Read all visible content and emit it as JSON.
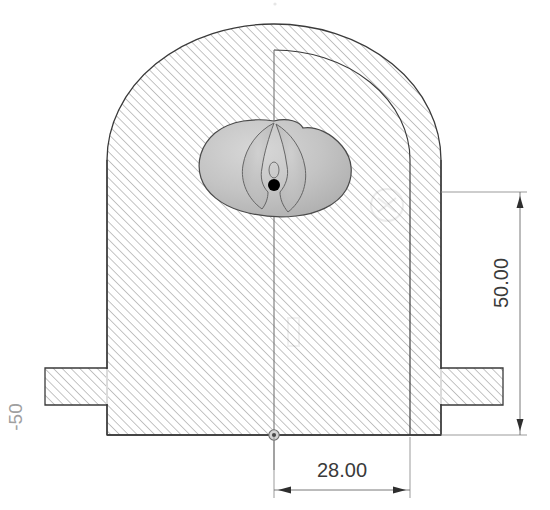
{
  "drawing": {
    "title": "Sectional View of Valve Body Casting",
    "type": "engineering-section-drawing",
    "background_color": "#ffffff",
    "line_color": "#3a3a3a",
    "hatch_color": "#9a9a9a",
    "shade_fill_light": "#c9c9c9",
    "shade_fill_dark": "#b0b0b0",
    "datum_color": "#000000"
  },
  "dimensions": [
    {
      "name": "vertical-height",
      "value": "50.00",
      "orientation": "vertical",
      "text_rotation_deg": -90,
      "arrow_style": "both-ends-inward",
      "text_x": 508,
      "text_y": 283
    },
    {
      "name": "horizontal-offset",
      "value": "28.00",
      "orientation": "horizontal",
      "text_rotation_deg": 0,
      "arrow_style": "both-ends-outward",
      "text_x": 342,
      "text_y": 475
    }
  ],
  "annotations": [
    {
      "name": "left-margin-label",
      "value": "-50",
      "text_rotation_deg": -90,
      "text_x": 22,
      "text_y": 417,
      "color": "#9a9a9a"
    }
  ],
  "markers": [
    {
      "name": "center-point-marker",
      "kind": "filled-dot",
      "x": 274,
      "y": 185,
      "radius": 6
    },
    {
      "name": "origin-datum-marker",
      "kind": "circle-crosshair",
      "x": 274,
      "y": 435,
      "radius": 5
    }
  ],
  "geometry": {
    "body_left_x": 107,
    "body_right_x": 441,
    "body_base_y": 435,
    "dome_apex_y": 24,
    "dome_spring_y": 160,
    "centerline_x": 274,
    "inner_profile_x": 410,
    "flange_top_y": 368,
    "flange_bottom_y": 405,
    "flange_left_x": 45,
    "flange_right_x": 503
  }
}
